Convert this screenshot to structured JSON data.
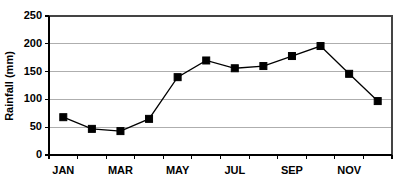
{
  "chart_data": {
    "type": "line",
    "title": "",
    "xlabel": "",
    "ylabel": "Rainfall (mm)",
    "categories": [
      "JAN",
      "FEB",
      "MAR",
      "APR",
      "MAY",
      "JUN",
      "JUL",
      "AUG",
      "SEP",
      "OCT",
      "NOV",
      "DEC"
    ],
    "visible_tick_labels": [
      "JAN",
      "MAR",
      "MAY",
      "JUL",
      "SEP",
      "NOV"
    ],
    "values": [
      68,
      47,
      43,
      65,
      140,
      170,
      156,
      160,
      178,
      196,
      146,
      97
    ],
    "ylim": [
      0,
      250
    ],
    "ytick_labels": [
      "250",
      "200",
      "150",
      "100",
      "50",
      "0"
    ],
    "ytick_values": [
      250,
      200,
      150,
      100,
      50,
      0
    ],
    "grid": true,
    "grid_axis": "y",
    "legend": false,
    "legend_position": "none",
    "marker": "square",
    "line_color": "#000000",
    "marker_color": "#000000",
    "grid_color": "#9a9a9a",
    "background_color": "#ffffff"
  },
  "axes": {
    "y_axis_title": "Rainfall (mm)"
  }
}
